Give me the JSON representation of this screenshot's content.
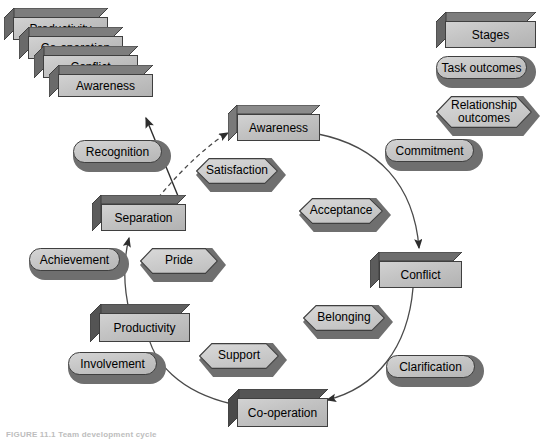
{
  "figure": {
    "caption": "FIGURE 11.1  Team development cycle",
    "shape_types": {
      "stage": "3d-rectangular-box",
      "task_outcome": "rounded-pill",
      "relationship_outcome": "hexagon-double-arrow"
    },
    "colors": {
      "face": "#c6c6c6",
      "shadow": "#6f6f6f",
      "outline": "#3f3f3f",
      "background": "#ffffff",
      "hex_face": "#cdcdcd",
      "text": "#1c1c1c"
    }
  },
  "legend": {
    "items": [
      {
        "label": "Stages",
        "type": "stage"
      },
      {
        "label": "Task outcomes",
        "type": "task_outcome"
      },
      {
        "label": "Relationship\noutcomes",
        "type": "relationship_outcome"
      }
    ],
    "item0_label": "Stages",
    "item1_label": "Task outcomes",
    "item2_line1": "Relationship",
    "item2_line2": "outcomes"
  },
  "stack": {
    "title": "repeating-cycle-stack",
    "layers": [
      {
        "label": "Productivity"
      },
      {
        "label": "Co-operation"
      },
      {
        "label": "Conflict"
      },
      {
        "label": "Awareness"
      }
    ],
    "layer0": "Productivity",
    "layer1": "Co-operation",
    "layer2": "Conflict",
    "layer3": "Awareness"
  },
  "cycle": {
    "stages": [
      {
        "label": "Awareness",
        "position": "top"
      },
      {
        "label": "Conflict",
        "position": "right"
      },
      {
        "label": "Co-operation",
        "position": "bottom"
      },
      {
        "label": "Productivity",
        "position": "bottom-left"
      },
      {
        "label": "Separation",
        "position": "upper-left"
      }
    ],
    "stage_awareness": "Awareness",
    "stage_conflict": "Conflict",
    "stage_cooperation": "Co-operation",
    "stage_productivity": "Productivity",
    "stage_separation": "Separation",
    "task_outcomes": [
      {
        "label": "Commitment",
        "near_stage": "Awareness"
      },
      {
        "label": "Clarification",
        "near_stage": "Conflict"
      },
      {
        "label": "Involvement",
        "near_stage": "Co-operation"
      },
      {
        "label": "Achievement",
        "near_stage": "Productivity"
      },
      {
        "label": "Recognition",
        "near_stage": "Separation"
      }
    ],
    "task_commitment": "Commitment",
    "task_clarification": "Clarification",
    "task_involvement": "Involvement",
    "task_achievement": "Achievement",
    "task_recognition": "Recognition",
    "relationship_outcomes": [
      {
        "label": "Satisfaction",
        "near_stage": "Awareness"
      },
      {
        "label": "Acceptance",
        "near_stage": "Conflict"
      },
      {
        "label": "Belonging",
        "near_stage": "Conflict"
      },
      {
        "label": "Support",
        "near_stage": "Co-operation"
      },
      {
        "label": "Pride",
        "near_stage": "Productivity"
      }
    ],
    "rel_satisfaction": "Satisfaction",
    "rel_acceptance": "Acceptance",
    "rel_belonging": "Belonging",
    "rel_support": "Support",
    "rel_pride": "Pride",
    "arrows": [
      {
        "from": "Awareness",
        "to": "Conflict",
        "style": "solid"
      },
      {
        "from": "Conflict",
        "to": "Co-operation",
        "style": "solid"
      },
      {
        "from": "Co-operation",
        "to": "Productivity",
        "style": "solid"
      },
      {
        "from": "Productivity",
        "to": "Separation",
        "style": "solid"
      },
      {
        "from": "Separation",
        "to": "Awareness",
        "style": "dashed"
      },
      {
        "from": "Separation",
        "to": "stack",
        "style": "solid"
      }
    ]
  }
}
